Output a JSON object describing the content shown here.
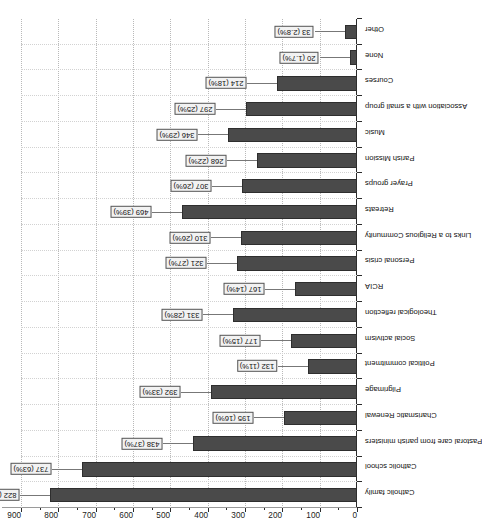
{
  "chart_data": {
    "type": "bar",
    "title": "",
    "subtitle": "",
    "xlabel": "",
    "ylabel": "",
    "orientation": "vertical-rotated-90",
    "grid": true,
    "legend": false,
    "ylim": [
      0,
      900
    ],
    "ytick_step": 100,
    "yticks": [
      "0",
      "100",
      "200",
      "300",
      "400",
      "500",
      "600",
      "700",
      "800",
      "900"
    ],
    "bar_color": "#4a4a4a",
    "categories": [
      "Catholic family",
      "Catholic school",
      "Pastoral care from parish ministers",
      "Charismatic Renewal",
      "Pilgrimage",
      "Political commitment",
      "Social activism",
      "Theological reflection",
      "RCIA",
      "Personal crisis",
      "Links to a Religious Community",
      "Retreats",
      "Prayer groups",
      "Parish Mission",
      "Music",
      "Association with a small group",
      "Courses",
      "None",
      "Other"
    ],
    "values": [
      822,
      737,
      438,
      195,
      392,
      132,
      177,
      331,
      167,
      321,
      310,
      469,
      307,
      268,
      346,
      297,
      214,
      20,
      33
    ],
    "percents": [
      "70%",
      "63%",
      "37%",
      "16%",
      "33%",
      "11%",
      "15%",
      "28%",
      "14%",
      "27%",
      "26%",
      "39%",
      "26%",
      "22%",
      "29%",
      "25%",
      "18%",
      "1.7%",
      "2.8%"
    ],
    "data_labels": [
      "822 (70%)",
      "737 (63%)",
      "438 (37%)",
      "195 (16%)",
      "392 (33%)",
      "132 (11%)",
      "177 (15%)",
      "331 (28%)",
      "167 (14%)",
      "321 (27%)",
      "310 (26%)",
      "469 (39%)",
      "307 (26%)",
      "268 (22%)",
      "346 (29%)",
      "297 (25%)",
      "214 (18%)",
      "20 (1.7%)",
      "33 (2.8%)"
    ]
  }
}
